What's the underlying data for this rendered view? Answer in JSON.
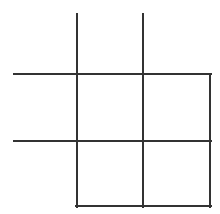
{
  "diagram": {
    "type": "tic-tac-toe-style grid",
    "stroke_color": "#333333",
    "stroke_width": 2,
    "background": "#ffffff",
    "lines": [
      {
        "id": "vertical-left",
        "x1": 77,
        "y1": 14,
        "x2": 77,
        "y2": 207
      },
      {
        "id": "vertical-middle",
        "x1": 143,
        "y1": 14,
        "x2": 143,
        "y2": 207
      },
      {
        "id": "vertical-right",
        "x1": 210,
        "y1": 74,
        "x2": 210,
        "y2": 207
      },
      {
        "id": "horizontal-top",
        "x1": 14,
        "y1": 74,
        "x2": 211,
        "y2": 74
      },
      {
        "id": "horizontal-mid",
        "x1": 14,
        "y1": 141,
        "x2": 211,
        "y2": 141
      },
      {
        "id": "horizontal-bottom",
        "x1": 76,
        "y1": 206,
        "x2": 211,
        "y2": 206
      }
    ]
  }
}
